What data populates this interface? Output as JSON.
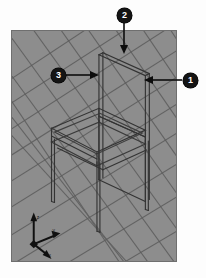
{
  "figure": {
    "type": "3d-viewport-callout-figure",
    "background_color": "#fdfdfd"
  },
  "viewport": {
    "name": "3d-perspective-viewport",
    "background_color": "#8d8d8d",
    "border_color": "#6f6f6f",
    "grid": {
      "visible": true,
      "line_color": "#5f5f5f",
      "type": "perspective-ground-plane",
      "direction_a_count": 13,
      "direction_b_count": 13
    },
    "model": {
      "name": "chair",
      "display_mode": "wireframe",
      "edge_color": "#3a3a3a",
      "parts": [
        "backrest-panel",
        "seat-frame",
        "leg-front-left",
        "leg-front-right",
        "leg-back-left",
        "leg-back-right"
      ]
    },
    "axis_gizmo": {
      "name": "axis-triad",
      "labels": [
        "z",
        "y",
        "x"
      ],
      "color": "#101010"
    }
  },
  "callouts": [
    {
      "id": "callout-1",
      "label": "1",
      "badge_x": 190,
      "badge_y": 80,
      "arrow_from_x": 182,
      "arrow_from_y": 80,
      "arrow_to_x": 146,
      "arrow_to_y": 80,
      "direction": "left",
      "target": "backrest-right-stile"
    },
    {
      "id": "callout-2",
      "label": "2",
      "badge_x": 124,
      "badge_y": 15,
      "arrow_from_x": 124,
      "arrow_from_y": 23,
      "arrow_to_x": 124,
      "arrow_to_y": 53,
      "direction": "down",
      "target": "backrest-top-rail"
    },
    {
      "id": "callout-3",
      "label": "3",
      "badge_x": 58,
      "badge_y": 75,
      "arrow_from_x": 66,
      "arrow_from_y": 75,
      "arrow_to_x": 98,
      "arrow_to_y": 75,
      "direction": "right",
      "target": "backrest-left-stile"
    }
  ]
}
